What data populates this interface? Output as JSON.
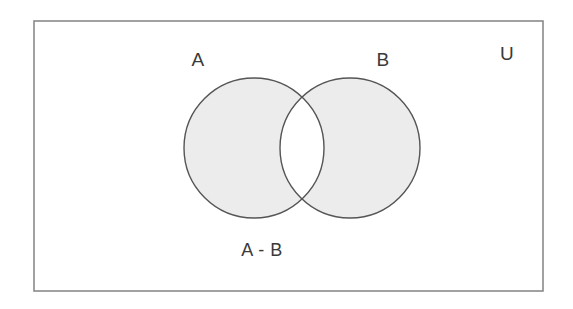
{
  "diagram": {
    "kind": "venn-diagram",
    "title_text": "",
    "universe": {
      "label": "U",
      "shape": "rectangle",
      "x": 34,
      "y": 21,
      "width": 509,
      "height": 270,
      "stroke_color": "#8a8a8a",
      "fill_color": "#ffffff",
      "label_x": 507,
      "label_y": 60
    },
    "sets": [
      {
        "label": "A",
        "cx": 254,
        "cy": 148,
        "r": 70,
        "fill_color": "#ececec",
        "stroke_color": "#555555",
        "label_x": 198,
        "label_y": 66
      },
      {
        "label": "B",
        "cx": 350,
        "cy": 148,
        "r": 70,
        "fill_color": "#ececec",
        "stroke_color": "#555555",
        "label_x": 383,
        "label_y": 66
      }
    ],
    "intersection": {
      "label": "",
      "fill_color": "#ffffff",
      "shaded": false
    },
    "caption": {
      "label": "A - B",
      "x": 262,
      "y": 256
    },
    "colors": {
      "background": "#ffffff",
      "shade": "#ececec",
      "outline": "#555555",
      "frame": "#8a8a8a",
      "text": "#3a3a3a"
    }
  }
}
